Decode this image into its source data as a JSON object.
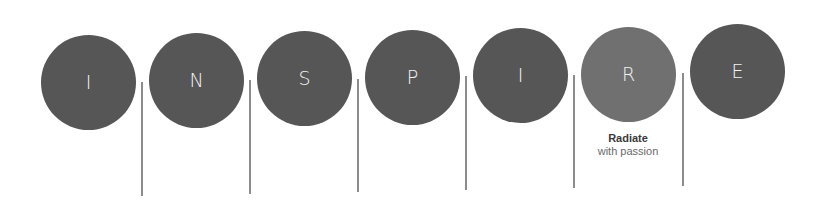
{
  "diagram": {
    "word": "INSPIRE",
    "colors": {
      "circle": "#565656",
      "circle_highlight": "#707070",
      "letter": "#f2f2f2",
      "divider": "#8c8c8c",
      "caption_title": "#3a3a3a",
      "caption_sub": "#6a6a6a"
    },
    "letters": [
      {
        "letter": "I",
        "highlighted": false
      },
      {
        "letter": "N",
        "highlighted": false
      },
      {
        "letter": "S",
        "highlighted": false
      },
      {
        "letter": "P",
        "highlighted": false
      },
      {
        "letter": "I",
        "highlighted": false
      },
      {
        "letter": "R",
        "highlighted": true,
        "caption_title": "Radiate",
        "caption_sub": "with passion"
      },
      {
        "letter": "E",
        "highlighted": false
      }
    ]
  }
}
